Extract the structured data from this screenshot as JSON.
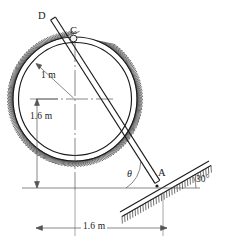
{
  "figure": {
    "type": "engineering-mechanics-diagram",
    "background_color": "#ffffff",
    "line_color": "#1a1a1a",
    "hatch_color": "#333333"
  },
  "labels": {
    "point_d": "D",
    "point_c": "C",
    "point_a": "A",
    "theta": "θ",
    "incline_angle": "30°",
    "radius_dim": "1 m",
    "height_dim": "1.6 m",
    "horizontal_dim": "1.6 m"
  },
  "geometry": {
    "circle_center_x": 75,
    "circle_center_y": 99,
    "circle_outer_radius": 62,
    "circle_inner_radius": 56,
    "point_c_x": 73,
    "point_c_y": 38,
    "point_d_x": 53,
    "point_d_y": 22,
    "point_a_x": 157,
    "point_a_y": 186,
    "baseline_y": 188,
    "baseline_x_start": 22,
    "baseline_x_end": 200,
    "incline_angle_deg": 30,
    "dim_line_y": 228,
    "dim_left_x": 36,
    "dim_right_x": 167
  },
  "chart_data": {
    "type": "diagram",
    "title": "",
    "annotations": [
      {
        "name": "radius",
        "text": "1 m",
        "value": 1.0,
        "unit": "m"
      },
      {
        "name": "center-height-above-base",
        "text": "1.6 m",
        "value": 1.6,
        "unit": "m"
      },
      {
        "name": "horizontal-distance",
        "text": "1.6 m",
        "value": 1.6,
        "unit": "m"
      },
      {
        "name": "incline-angle",
        "text": "30°",
        "value": 30,
        "unit": "deg"
      },
      {
        "name": "rod-angle",
        "text": "θ",
        "value": null,
        "unit": "deg"
      }
    ],
    "points": [
      "D",
      "C",
      "A"
    ]
  }
}
